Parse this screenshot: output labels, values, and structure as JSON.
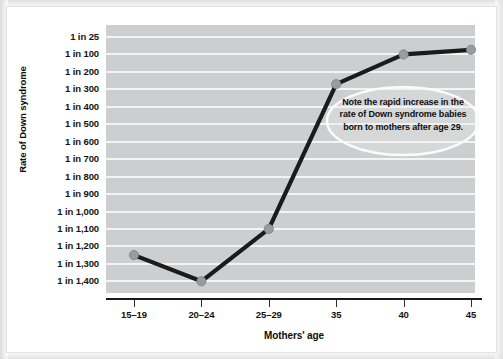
{
  "figure": {
    "y_axis_title": "Rate of Down syndrome",
    "x_axis_title": "Mothers' age",
    "callout_text": "Note the rapid increase in the rate of Down syndrome babies born to mothers after age 29.",
    "colors": {
      "plot_background": "#cdcecf",
      "gridline": "#f4f4f4",
      "line": "#1b1b1b",
      "marker_fill": "#9a9b9c",
      "axis": "#1a1a1a",
      "page_background": "#ffffff",
      "text": "#111111"
    }
  },
  "chart_data": {
    "type": "line",
    "title": "",
    "subtitle": "",
    "xlabel": "Mothers' age",
    "ylabel": "Rate of Down syndrome",
    "grid": true,
    "legend": "none",
    "annotations": [
      {
        "text": "Note the rapid increase in the rate of Down syndrome babies born to mothers after age 29.",
        "shape": "ellipse",
        "position": "upper-right"
      }
    ],
    "categories": [
      "15–19",
      "20–24",
      "25–29",
      "35",
      "40",
      "45"
    ],
    "x_tick_labels": [
      "15–19",
      "20–24",
      "25–29",
      "35",
      "40",
      "45"
    ],
    "y_tick_labels": [
      "1 in 25",
      "1 in 100",
      "1 in 200",
      "1 in 300",
      "1 in 400",
      "1 in 500",
      "1 in 600",
      "1 in 700",
      "1 in 800",
      "1 in 900",
      "1 in 1,000",
      "1 in 1,100",
      "1 in 1,200",
      "1 in 1,300",
      "1 in 1,400"
    ],
    "y_tick_denominators": [
      25,
      100,
      200,
      300,
      400,
      500,
      600,
      700,
      800,
      900,
      1000,
      1100,
      1200,
      1300,
      1400
    ],
    "y_axis_direction": "inverted (larger denominator = lower on axis)",
    "series": [
      {
        "name": "Rate of Down syndrome",
        "values": [
          "1 in 1,250",
          "1 in 1,400",
          "1 in 1,100",
          "1 in 270",
          "1 in 100",
          "1 in 80"
        ],
        "denominators": [
          1250,
          1400,
          1100,
          270,
          100,
          80
        ]
      }
    ]
  }
}
